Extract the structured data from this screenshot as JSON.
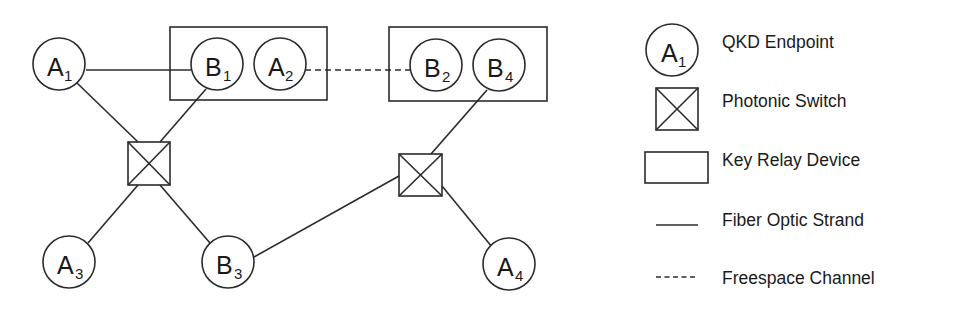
{
  "diagram": {
    "title": "",
    "nodes": {
      "A1": {
        "letter": "A",
        "sub": "1",
        "type": "QKD Endpoint"
      },
      "B1": {
        "letter": "B",
        "sub": "1",
        "type": "QKD Endpoint"
      },
      "A2": {
        "letter": "A",
        "sub": "2",
        "type": "QKD Endpoint"
      },
      "B2": {
        "letter": "B",
        "sub": "2",
        "type": "QKD Endpoint"
      },
      "B4": {
        "letter": "B",
        "sub": "4",
        "type": "QKD Endpoint"
      },
      "A3": {
        "letter": "A",
        "sub": "3",
        "type": "QKD Endpoint"
      },
      "B3": {
        "letter": "B",
        "sub": "3",
        "type": "QKD Endpoint"
      },
      "A4": {
        "letter": "A",
        "sub": "4",
        "type": "QKD Endpoint"
      }
    },
    "switches": [
      "switch-left",
      "switch-right"
    ],
    "relay_devices": [
      [
        "B1",
        "A2"
      ],
      [
        "B2",
        "B4"
      ]
    ],
    "links": [
      {
        "from": "A1",
        "to": "B1",
        "kind": "fiber"
      },
      {
        "from": "A1",
        "to": "switch-left",
        "kind": "fiber"
      },
      {
        "from": "B1",
        "to": "switch-left",
        "kind": "fiber"
      },
      {
        "from": "switch-left",
        "to": "A3",
        "kind": "fiber"
      },
      {
        "from": "switch-left",
        "to": "B3",
        "kind": "fiber"
      },
      {
        "from": "A2",
        "to": "B2",
        "kind": "freespace"
      },
      {
        "from": "B4",
        "to": "switch-right",
        "kind": "fiber"
      },
      {
        "from": "B3",
        "to": "switch-right",
        "kind": "fiber"
      },
      {
        "from": "switch-right",
        "to": "A4",
        "kind": "fiber"
      }
    ]
  },
  "legend": {
    "items": [
      {
        "symbol": "circle",
        "letter": "A",
        "sub": "1",
        "label": "QKD Endpoint"
      },
      {
        "symbol": "crossed-square",
        "label": "Photonic Switch"
      },
      {
        "symbol": "rectangle",
        "label": "Key Relay Device"
      },
      {
        "symbol": "solid-line",
        "label": "Fiber Optic Strand"
      },
      {
        "symbol": "dashed-line",
        "label": "Freespace Channel"
      }
    ]
  }
}
